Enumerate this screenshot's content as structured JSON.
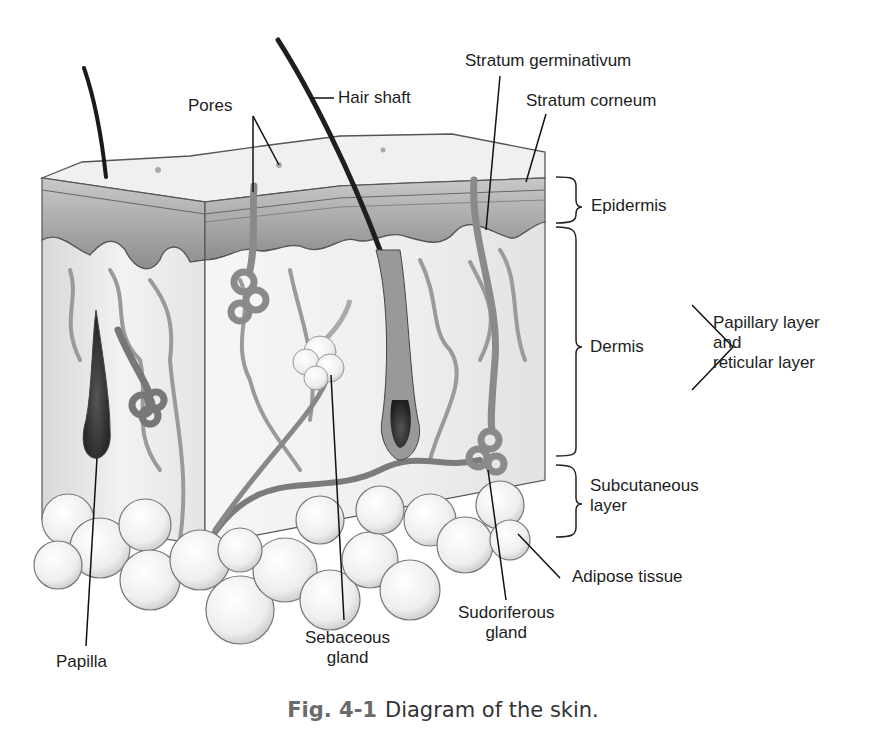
{
  "figure": {
    "caption_number": "Fig. 4-1",
    "caption_text": "Diagram of the skin."
  },
  "labels": {
    "pores": "Pores",
    "hair_shaft": "Hair shaft",
    "stratum_germinativum": "Stratum germinativum",
    "stratum_corneum": "Stratum corneum",
    "epidermis": "Epidermis",
    "dermis": "Dermis",
    "dermis_sublayers": [
      "Papillary layer",
      "and",
      "reticular layer"
    ],
    "subcutaneous": [
      "Subcutaneous",
      "layer"
    ],
    "adipose_tissue": "Adipose tissue",
    "sudoriferous_gland": [
      "Sudoriferous",
      "gland"
    ],
    "sebaceous_gland": [
      "Sebaceous",
      "gland"
    ],
    "papilla": "Papilla"
  },
  "colors": {
    "surface": "#eeeeee",
    "epidermis": "#9a9a9a",
    "dermis": "#f3f3f3",
    "vessels": "#8f8f8f",
    "hair": "#222222",
    "fat": "#f7f7f7"
  }
}
